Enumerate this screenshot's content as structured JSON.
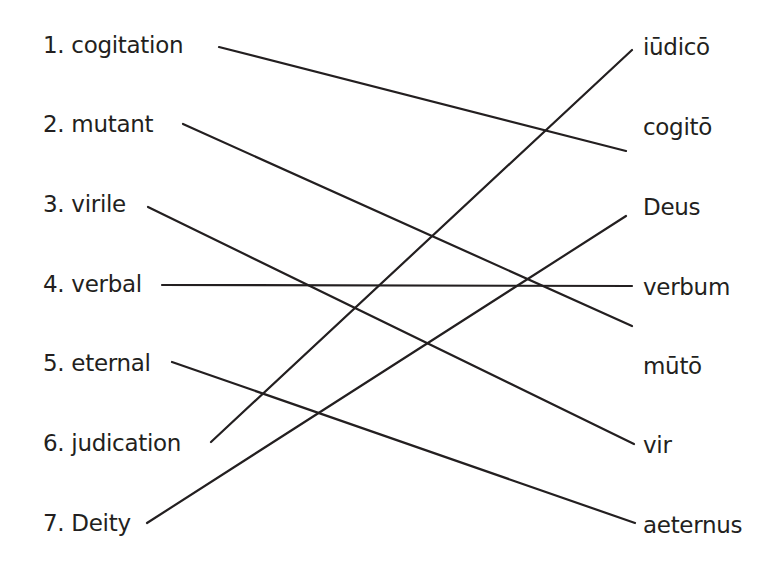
{
  "left_words": [
    {
      "num": "1.",
      "word": "cogitation",
      "label": "1. cogitation"
    },
    {
      "num": "2.",
      "word": "mutant",
      "label": "2. mutant"
    },
    {
      "num": "3.",
      "word": "virile",
      "label": "3. virile"
    },
    {
      "num": "4.",
      "word": "verbal",
      "label": "4. verbal"
    },
    {
      "num": "5.",
      "word": "eternal",
      "label": "5. eternal"
    },
    {
      "num": "6.",
      "word": "judication",
      "label": "6. judication"
    },
    {
      "num": "7.",
      "word": "Deity",
      "label": "7. Deity"
    }
  ],
  "right_words": [
    {
      "label": "iūdicō"
    },
    {
      "label": "cogitō"
    },
    {
      "label": "Deus"
    },
    {
      "label": "verbum"
    },
    {
      "label": "mūtō"
    },
    {
      "label": "vir"
    },
    {
      "label": "aeternus"
    }
  ],
  "matches": [
    {
      "left": "cogitation",
      "right": "cogitō"
    },
    {
      "left": "mutant",
      "right": "mūtō"
    },
    {
      "left": "virile",
      "right": "vir"
    },
    {
      "left": "verbal",
      "right": "verbum"
    },
    {
      "left": "eternal",
      "right": "aeternus"
    },
    {
      "left": "judication",
      "right": "iūdicō"
    },
    {
      "left": "Deity",
      "right": "Deus"
    }
  ],
  "colors": {
    "ink": "#231f20",
    "background": "#ffffff"
  }
}
